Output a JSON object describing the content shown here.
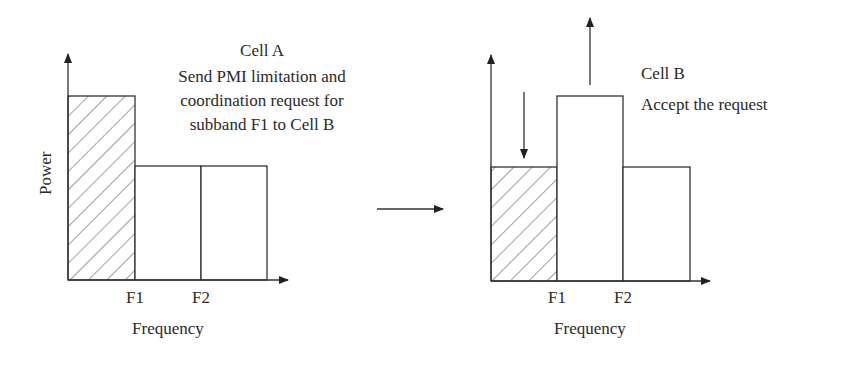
{
  "left_panel": {
    "title": "Cell A",
    "description_lines": [
      "Send PMI limitation and",
      "coordination request for",
      "subband F1 to Cell B"
    ],
    "y_axis_label": "Power",
    "x_axis_label": "Frequency",
    "ticks": [
      "F1",
      "F2"
    ],
    "bars": [
      {
        "range": "0-F1",
        "level": "high",
        "hatched": true
      },
      {
        "range": "F1-F2",
        "level": "medium",
        "hatched": false
      },
      {
        "range": "F2-end",
        "level": "medium",
        "hatched": false
      }
    ]
  },
  "transition_arrow": "right-arrow",
  "right_panel": {
    "title": "Cell B",
    "description_lines": [
      "Accept the request"
    ],
    "x_axis_label": "Frequency",
    "ticks": [
      "F1",
      "F2"
    ],
    "bars": [
      {
        "range": "0-F1",
        "level": "medium",
        "hatched": true,
        "change": "decrease"
      },
      {
        "range": "F1-F2",
        "level": "high",
        "hatched": false,
        "change": "increase"
      },
      {
        "range": "F2-end",
        "level": "medium",
        "hatched": false
      }
    ]
  }
}
